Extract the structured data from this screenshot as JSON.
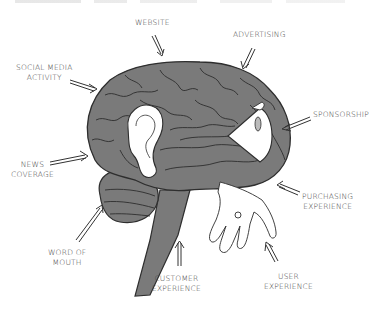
{
  "diagram": {
    "colors": {
      "brain_fill": "#7a7a7a",
      "brain_line": "#2e2e2e",
      "white_parts": "#ffffff",
      "label_text": "#444444",
      "arrow": "#333333"
    },
    "labels": {
      "website": "WEBSITE",
      "advertising": "ADVERTISING",
      "social_media": "SOCIAL MEDIA\nACTIVITY",
      "sponsorship": "SPONSORSHIP",
      "news_coverage": "NEWS\nCOVERAGE",
      "purchasing_experience": "PURCHASING\nEXPERIENCE",
      "word_of_mouth": "WORD OF\nMOUTH",
      "customer_experience": "CUSTOMER\nEXPERIENCE",
      "user_experience": "USER\nEXPERIENCE"
    },
    "icons": {
      "ear": "ear-icon",
      "eye_cone": "eye-cone-icon",
      "hand": "hand-icon"
    }
  }
}
